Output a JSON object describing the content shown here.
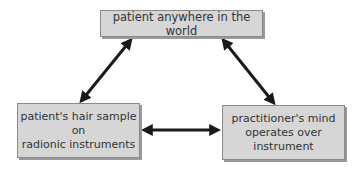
{
  "diagram": {
    "nodes": {
      "top": {
        "lines": [
          "patient anywhere in the world"
        ]
      },
      "left": {
        "lines": [
          "patient's hair sample",
          "on",
          "radionic instruments"
        ]
      },
      "right": {
        "lines": [
          "practitioner's mind",
          "operates over",
          "instrument"
        ]
      }
    },
    "edges": [
      {
        "from": "top",
        "to": "left",
        "direction": "bidirectional"
      },
      {
        "from": "top",
        "to": "right",
        "direction": "bidirectional"
      },
      {
        "from": "left",
        "to": "right",
        "direction": "bidirectional"
      }
    ],
    "colors": {
      "box_fill": "#d6d6d6",
      "box_border": "#8a8a8a",
      "arrow": "#1a1a1a",
      "text": "#333333"
    }
  }
}
